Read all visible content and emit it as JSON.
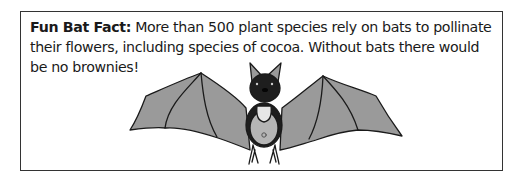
{
  "fact_box": {
    "label": "Fun Bat Fact:",
    "text": " More than 500 plant species rely on bats to pollinate their flowers, including species of cocoa. Without bats there would be no brownies!"
  },
  "illustration": {
    "subject": "bat-icon",
    "wing_color": "#9a9a9a",
    "head_color": "#1e1e1e",
    "belly_color": "#b5b5b5",
    "bib_color": "#e6e6e6"
  },
  "colors": {
    "border": "#333333",
    "text": "#1a1a1a"
  }
}
